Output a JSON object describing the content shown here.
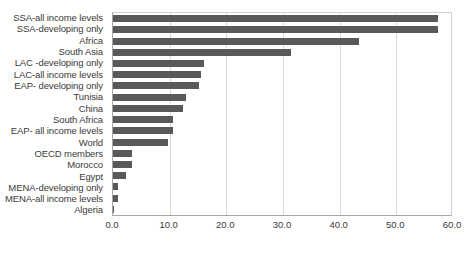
{
  "chart_data": {
    "type": "bar",
    "orientation": "horizontal",
    "title": "",
    "subtitle": "",
    "xlabel": "",
    "ylabel": "",
    "xlim": [
      0.0,
      60.0
    ],
    "xticks": [
      "0.0",
      "10.0",
      "20.0",
      "30.0",
      "40.0",
      "50.0",
      "60.0"
    ],
    "xtick_values": [
      0.0,
      10.0,
      20.0,
      30.0,
      40.0,
      50.0,
      60.0
    ],
    "grid": true,
    "grid_axis": "x",
    "legend": null,
    "legend_position": "none",
    "bar_color": "#595959",
    "categories": [
      "SSA-all income levels",
      "SSA-developing only",
      "Africa",
      "South Asia",
      "LAC -developing only",
      "LAC-all income levels",
      "EAP- developing only",
      "Tunisia",
      "China",
      "South Africa",
      "EAP- all income levels",
      "World",
      "OECD members",
      "Morocco",
      "Egypt",
      "MENA-developing only",
      "MENA-all income levels",
      "Algeria"
    ],
    "values": [
      57.4,
      57.3,
      43.4,
      31.4,
      16.0,
      15.5,
      15.2,
      12.9,
      12.3,
      10.6,
      10.6,
      9.7,
      3.3,
      3.3,
      2.3,
      0.9,
      0.8,
      0.2
    ]
  }
}
